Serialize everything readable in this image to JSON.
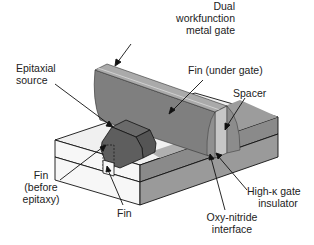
{
  "diagram": {
    "type": "3D FinFET device cross-section illustration",
    "colors": {
      "gate_dark": "#7d7d7d",
      "gate_top": "#a9a9a9",
      "spacer_light": "#c4c4c4",
      "substrate_top_light": "#f2f2f2",
      "substrate_side_light": "#e6e6e6",
      "substrate_right_gray": "#8e8e8e",
      "epi_dark": "#5a5a5a",
      "line": "#111111"
    },
    "labels": {
      "gate": [
        "Dual",
        "workfunction",
        "metal gate"
      ],
      "epi_source": [
        "Epitaxial",
        "source"
      ],
      "fin_under_gate": "Fin (under gate)",
      "spacer": "Spacer",
      "fin_before_epi": [
        "Fin",
        "(before",
        "epitaxy)"
      ],
      "fin": "Fin",
      "high_k": [
        "High-κ gate",
        "insulator"
      ],
      "oxy_nitride": [
        "Oxy-nitride",
        "interface"
      ]
    }
  }
}
